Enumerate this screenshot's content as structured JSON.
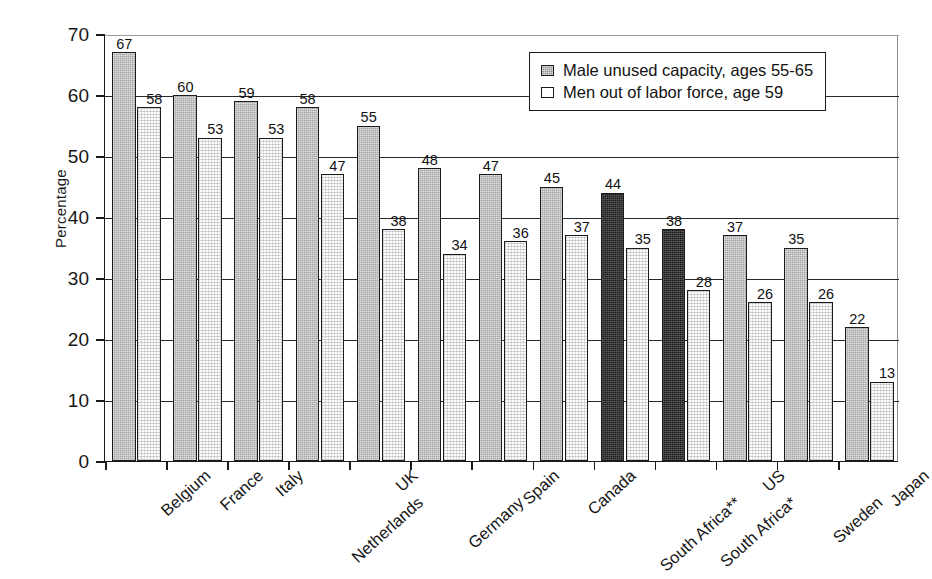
{
  "chart_data": {
    "type": "bar",
    "title": "",
    "xlabel": "",
    "ylabel": "Percentage",
    "ylim": [
      0,
      70
    ],
    "ytick_step": 10,
    "yticks": [
      "70",
      "60",
      "50",
      "40",
      "30",
      "20",
      "10",
      "0"
    ],
    "grid": true,
    "grid_axis": "y",
    "legend_position": "top-right-inside",
    "categories": [
      "Belgium",
      "France",
      "Italy",
      "Netherlands",
      "UK",
      "Germany",
      "Spain",
      "Canada",
      "South Africa**",
      "South Africa*",
      "US",
      "Sweden",
      "Japan"
    ],
    "series": [
      {
        "name": "Male unused capacity, ages 55-65",
        "color": "#a3a3a3",
        "highlight_color": "#1d1d1d",
        "highlight_categories": [
          "South Africa**",
          "South Africa*"
        ],
        "values": [
          67,
          60,
          59,
          58,
          55,
          48,
          47,
          45,
          44,
          38,
          37,
          35,
          22
        ],
        "labels": [
          "67",
          "60",
          "59",
          "58",
          "55",
          "48",
          "47",
          "45",
          "44",
          "38",
          "37",
          "35",
          "22"
        ]
      },
      {
        "name": "Men out of labor force, age 59",
        "color": "#fbfbfb",
        "values": [
          58,
          53,
          53,
          47,
          38,
          34,
          36,
          37,
          35,
          28,
          26,
          26,
          13
        ],
        "labels": [
          "58",
          "53",
          "53",
          "47",
          "38",
          "34",
          "36",
          "37",
          "35",
          "28",
          "26",
          "26",
          "13"
        ]
      }
    ]
  },
  "legend": {
    "entries": [
      {
        "label": "Male unused capacity, ages 55-65",
        "swatch": "dark-gray-dither"
      },
      {
        "label": "Men out of labor force, age 59",
        "swatch": "white-outline"
      }
    ]
  },
  "axes": {
    "y_title": "Percentage"
  }
}
